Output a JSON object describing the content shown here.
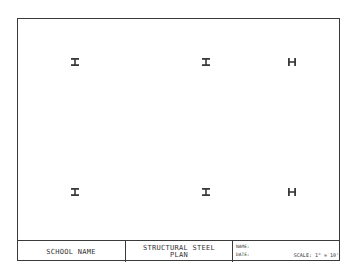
{
  "drawing": {
    "type": "structural steel plan",
    "columns": [
      {
        "row": 1,
        "position": 1,
        "symbol": "I-beam",
        "x": 75,
        "y": 62
      },
      {
        "row": 1,
        "position": 2,
        "symbol": "I-beam",
        "x": 206,
        "y": 62
      },
      {
        "row": 1,
        "position": 3,
        "symbol": "H-beam",
        "x": 292,
        "y": 62
      },
      {
        "row": 2,
        "position": 1,
        "symbol": "I-beam",
        "x": 75,
        "y": 192
      },
      {
        "row": 2,
        "position": 2,
        "symbol": "I-beam",
        "x": 206,
        "y": 192
      },
      {
        "row": 2,
        "position": 3,
        "symbol": "H-beam",
        "x": 292,
        "y": 192
      }
    ],
    "line_color": "#3a3a3a"
  },
  "title_block": {
    "project": "SCHOOL NAME",
    "title_line1": "STRUCTURAL STEEL",
    "title_line2": "PLAN",
    "name_label": "NAME:",
    "date_label": "DATE:",
    "scale": "SCALE: 1\" = 10'"
  }
}
